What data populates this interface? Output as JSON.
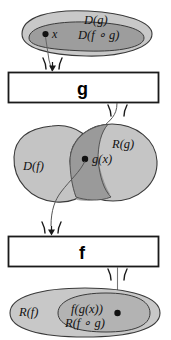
{
  "diagram": {
    "colors": {
      "outer_set_fill": "#c8c8c8",
      "inner_set_fill": "#9d9d9d",
      "lobe_fill": "#c4c4c4",
      "intersection_fill": "#9a9a9a",
      "stroke": "#3a3a3a",
      "line": "#555555",
      "box_stroke": "#1a1a1a",
      "box_fill": "#ffffff",
      "text": "#111111",
      "background": "#ffffff"
    },
    "top_set": {
      "outer_label": "D(g)",
      "inner_label": "D(f ∘ g)",
      "point_label": "x"
    },
    "box_g": {
      "label": "g"
    },
    "middle_sets": {
      "left_label": "D(f)",
      "right_label": "R(g)",
      "point_label": "g(x)"
    },
    "box_f": {
      "label": "f"
    },
    "bottom_set": {
      "outer_label": "R(f)",
      "inner_label_top": "f(g(x))",
      "inner_label_bottom": "R(f ∘ g)"
    }
  }
}
